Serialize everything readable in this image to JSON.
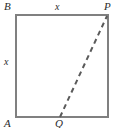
{
  "figure": {
    "type": "geometry-diagram",
    "shape": "square",
    "background_color": "#ffffff",
    "stroke_color": "#808080",
    "label_color": "#2b2b2b",
    "square": {
      "left": 16,
      "top": 15,
      "right": 108,
      "bottom": 117,
      "stroke_width": 2
    },
    "dashed_segment": {
      "from": "Q",
      "to": "P",
      "x1": 60,
      "y1": 117,
      "x2": 107,
      "y2": 16,
      "stroke_width": 2,
      "dash_pattern": "5 4"
    },
    "vertices": [
      {
        "name": "B",
        "label": "B",
        "position": "top-left"
      },
      {
        "name": "P",
        "label": "P",
        "position": "top-right"
      },
      {
        "name": "A",
        "label": "A",
        "position": "bottom-left"
      }
    ],
    "points": [
      {
        "name": "Q",
        "label": "Q",
        "position": "bottom-edge"
      }
    ],
    "side_labels": [
      {
        "name": "top",
        "label": "x"
      },
      {
        "name": "left",
        "label": "x"
      }
    ]
  }
}
